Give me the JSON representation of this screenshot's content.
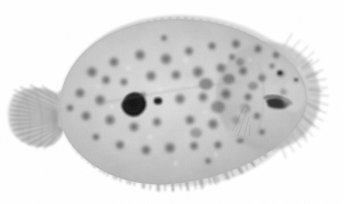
{
  "image": {
    "subject": "flatfish",
    "common_name": "Flounder",
    "view": "lateral whole-body, head to the right, tail to the left",
    "medium": "grayscale specimen photograph",
    "background_color": "#ffffff",
    "width": 344,
    "height": 204,
    "alt_text": "Grayscale photograph of a flounder seen from its eyed side, head to the right, showing a mottled spotted oval body fringed by dorsal and anal fin rays and a fan-shaped tail fin at the left."
  },
  "palette": {
    "background": "#ffffff",
    "body_light": "#d6d6d6",
    "body_mid": "#b4b4b4",
    "body_shadow": "#9a9a9a",
    "spot_light": "#8e8e8e",
    "spot_mid": "#6e6e6e",
    "spot_dark": "#4a4a4a",
    "blotch_black": "#101010",
    "fin_ray": "#5c5c5c",
    "fin_membrane": "#d2d2d2",
    "eye_dark": "#2a2a2a",
    "mouth_dark": "#1c1c1c"
  },
  "anatomy": {
    "body": {
      "label": "body",
      "shape": "broad oval / rhombic disc",
      "center_x": 178,
      "center_y": 100,
      "radius_x": 118,
      "radius_y": 66
    },
    "head": {
      "label": "head",
      "position": "right end of body",
      "center_x": 285,
      "center_y": 97
    },
    "eye": {
      "label": "eye",
      "center_x": 281,
      "center_y": 74,
      "radius": 4
    },
    "second_eye": {
      "label": "second-eye",
      "center_x": 296,
      "center_y": 80,
      "radius": 3
    },
    "mouth": {
      "label": "mouth",
      "center_x": 278,
      "center_y": 104,
      "width": 20,
      "height": 8
    },
    "caudal_fin": {
      "label": "caudal-fin",
      "center_x": 40,
      "center_y": 115,
      "radius_x": 30,
      "radius_y": 33,
      "ray_count": 22
    },
    "dorsal_fin": {
      "label": "dorsal-fin",
      "edge": "upper margin, from tail base to snout",
      "ray_count": 92
    },
    "anal_fin": {
      "label": "anal-fin",
      "edge": "lower margin, from tail base to head",
      "ray_count": 88
    },
    "pectoral_fin": {
      "label": "pectoral-fin",
      "center_x": 247,
      "center_y": 118
    },
    "lateral_line": {
      "label": "lateral-line",
      "note": "faint arched line over the pectoral region"
    }
  },
  "markings": {
    "description": "dense irregular ocellated spots scattered over the eyed side, denser and darker toward the head",
    "primary_blotch": {
      "label": "primary-dark-blotch",
      "center_x": 133,
      "center_y": 103,
      "radius": 10,
      "color": "#101010"
    },
    "secondary_blotch": {
      "label": "secondary-dark-blotch",
      "center_x": 158,
      "center_y": 101,
      "radius": 4,
      "color": "#1a1a1a"
    },
    "spots": [
      {
        "x": 92,
        "y": 72,
        "r": 6.5,
        "tone": "#7c7c7c"
      },
      {
        "x": 114,
        "y": 62,
        "r": 6.0,
        "tone": "#7a7a7a"
      },
      {
        "x": 140,
        "y": 55,
        "r": 6.5,
        "tone": "#6f6f6f"
      },
      {
        "x": 166,
        "y": 59,
        "r": 7.0,
        "tone": "#757575"
      },
      {
        "x": 189,
        "y": 51,
        "r": 5.5,
        "tone": "#6a6a6a"
      },
      {
        "x": 212,
        "y": 46,
        "r": 5.0,
        "tone": "#767676"
      },
      {
        "x": 236,
        "y": 44,
        "r": 5.5,
        "tone": "#6c6c6c"
      },
      {
        "x": 258,
        "y": 49,
        "r": 5.0,
        "tone": "#707070"
      },
      {
        "x": 276,
        "y": 55,
        "r": 4.5,
        "tone": "#6a6a6a"
      },
      {
        "x": 80,
        "y": 93,
        "r": 6.0,
        "tone": "#828282"
      },
      {
        "x": 100,
        "y": 100,
        "r": 6.5,
        "tone": "#7a7a7a"
      },
      {
        "x": 106,
        "y": 80,
        "r": 5.5,
        "tone": "#7e7e7e"
      },
      {
        "x": 124,
        "y": 82,
        "r": 5.0,
        "tone": "#8a8a8a"
      },
      {
        "x": 151,
        "y": 76,
        "r": 6.5,
        "tone": "#6e6e6e"
      },
      {
        "x": 176,
        "y": 75,
        "r": 6.0,
        "tone": "#757575"
      },
      {
        "x": 198,
        "y": 72,
        "r": 7.0,
        "tone": "#5e5e5e"
      },
      {
        "x": 221,
        "y": 68,
        "r": 6.0,
        "tone": "#5a5a5a"
      },
      {
        "x": 243,
        "y": 71,
        "r": 5.5,
        "tone": "#5f5f5f"
      },
      {
        "x": 262,
        "y": 78,
        "r": 5.0,
        "tone": "#666666"
      },
      {
        "x": 86,
        "y": 116,
        "r": 6.0,
        "tone": "#7e7e7e"
      },
      {
        "x": 110,
        "y": 120,
        "r": 6.5,
        "tone": "#787878"
      },
      {
        "x": 134,
        "y": 127,
        "r": 6.0,
        "tone": "#747474"
      },
      {
        "x": 157,
        "y": 122,
        "r": 5.5,
        "tone": "#7c7c7c"
      },
      {
        "x": 180,
        "y": 99,
        "r": 6.5,
        "tone": "#6c6c6c"
      },
      {
        "x": 203,
        "y": 97,
        "r": 6.0,
        "tone": "#5c5c5c"
      },
      {
        "x": 226,
        "y": 94,
        "r": 6.5,
        "tone": "#585858"
      },
      {
        "x": 248,
        "y": 97,
        "r": 5.0,
        "tone": "#636363"
      },
      {
        "x": 190,
        "y": 120,
        "r": 6.0,
        "tone": "#6a6a6a"
      },
      {
        "x": 213,
        "y": 124,
        "r": 6.5,
        "tone": "#5e5e5e"
      },
      {
        "x": 236,
        "y": 120,
        "r": 5.5,
        "tone": "#606060"
      },
      {
        "x": 257,
        "y": 116,
        "r": 4.5,
        "tone": "#6a6a6a"
      },
      {
        "x": 120,
        "y": 145,
        "r": 5.5,
        "tone": "#828282"
      },
      {
        "x": 146,
        "y": 150,
        "r": 6.0,
        "tone": "#7a7a7a"
      },
      {
        "x": 170,
        "y": 148,
        "r": 6.5,
        "tone": "#6e6e6e"
      },
      {
        "x": 194,
        "y": 146,
        "r": 5.5,
        "tone": "#707070"
      },
      {
        "x": 218,
        "y": 145,
        "r": 5.0,
        "tone": "#6c6c6c"
      },
      {
        "x": 240,
        "y": 140,
        "r": 4.5,
        "tone": "#747474"
      },
      {
        "x": 70,
        "y": 108,
        "r": 4.5,
        "tone": "#8a8a8a"
      },
      {
        "x": 164,
        "y": 38,
        "r": 4.0,
        "tone": "#7a7a7a"
      },
      {
        "x": 208,
        "y": 161,
        "r": 4.0,
        "tone": "#7e7e7e"
      },
      {
        "x": 262,
        "y": 132,
        "r": 4.0,
        "tone": "#666666"
      },
      {
        "x": 284,
        "y": 92,
        "r": 4.0,
        "tone": "#5a5a5a"
      },
      {
        "x": 272,
        "y": 66,
        "r": 3.5,
        "tone": "#5a5a5a"
      },
      {
        "x": 143,
        "y": 95,
        "r": 4.0,
        "tone": "#888888"
      },
      {
        "x": 96,
        "y": 137,
        "r": 4.5,
        "tone": "#868686"
      },
      {
        "x": 232,
        "y": 57,
        "r": 4.0,
        "tone": "#6e6e6e"
      }
    ]
  }
}
